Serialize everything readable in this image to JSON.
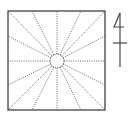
{
  "diagram": {
    "type": "radial-square-diagram",
    "square": {
      "x": 8,
      "y": 11,
      "width": 97,
      "height": 99,
      "stroke": "#333333"
    },
    "center_circle": {
      "cx": 57,
      "cy": 61,
      "r": 7,
      "stroke": "#333333"
    },
    "rays": {
      "count": 16,
      "style": "dotted",
      "color": "#555555",
      "endpoints": [
        [
          8,
          11
        ],
        [
          32,
          11
        ],
        [
          57,
          11
        ],
        [
          81,
          11
        ],
        [
          105,
          11
        ],
        [
          105,
          36
        ],
        [
          105,
          61
        ],
        [
          105,
          85
        ],
        [
          105,
          110
        ],
        [
          81,
          110
        ],
        [
          57,
          110
        ],
        [
          32,
          110
        ],
        [
          8,
          110
        ],
        [
          8,
          85
        ],
        [
          8,
          61
        ],
        [
          8,
          36
        ]
      ]
    },
    "north_symbol": {
      "label": "4",
      "stroke": "#444444"
    }
  }
}
